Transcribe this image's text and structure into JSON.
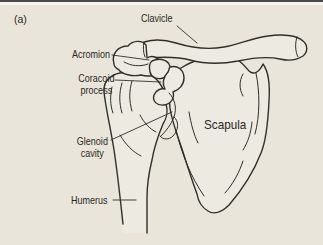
{
  "panel_label": "(a)",
  "labels": {
    "clavicle": "Clavicle",
    "acromion": "Acromion",
    "coracoid_process": "Coracoid process",
    "glenoid_cavity": "Glenoid cavity",
    "scapula": "Scapula",
    "humerus": "Humerus"
  },
  "colors": {
    "background": "#e9e5db",
    "bone_fill": "#edeae2",
    "line": "#322f2a",
    "text": "#2b2824",
    "top_bar": "#4a4a4a",
    "top_strip": "#f5f4f0"
  }
}
